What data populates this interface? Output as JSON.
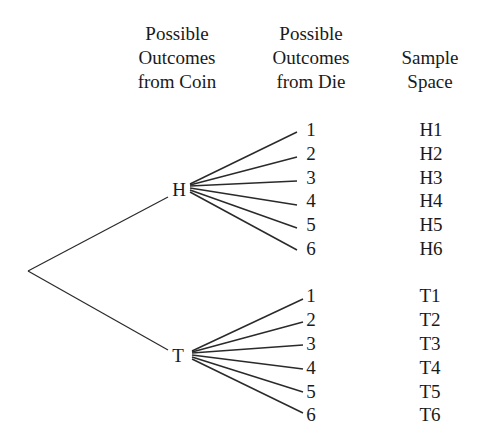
{
  "headers": {
    "coin": [
      "Possible",
      "Outcomes",
      "from Coin"
    ],
    "die": [
      "Possible",
      "Outcomes",
      "from Die"
    ],
    "sample": [
      "Sample",
      "Space"
    ]
  },
  "coin_outcomes": [
    "H",
    "T"
  ],
  "die_outcomes": [
    "1",
    "2",
    "3",
    "4",
    "5",
    "6"
  ],
  "sample_space": {
    "H": [
      "H1",
      "H2",
      "H3",
      "H4",
      "H5",
      "H6"
    ],
    "T": [
      "T1",
      "T2",
      "T3",
      "T4",
      "T5",
      "T6"
    ]
  },
  "colors": {
    "line": "#2a2a2a",
    "text": "#1a1a1a",
    "background": "#ffffff"
  }
}
